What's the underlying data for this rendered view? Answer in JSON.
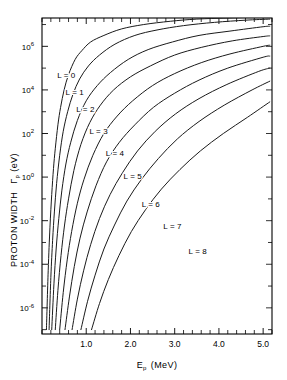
{
  "chart_data": {
    "type": "line",
    "title": "",
    "xlabel": "E_p (MeV)",
    "xlabel_main": "E",
    "xlabel_sub": "p",
    "xlabel_unit": "(MeV)",
    "ylabel": "PROTON WIDTH Γ_p (eV)",
    "ylabel_main": "PROTON  WIDTH",
    "ylabel_symbol": "Γ",
    "ylabel_symbol_sub": "p",
    "ylabel_unit": "(eV)",
    "xlim": [
      0.0,
      5.2
    ],
    "ylim_log10": [
      -7.2,
      7.3
    ],
    "xscale": "linear",
    "yscale": "log",
    "grid": false,
    "legend_position": "inline-annotations",
    "xticks_major": [
      1.0,
      2.0,
      3.0,
      4.0,
      5.0
    ],
    "xtick_labels": [
      "1.0",
      "2.0",
      "3.0",
      "4.0",
      "5.0"
    ],
    "xticks_minor_step": 0.2,
    "yticks_major_log10": [
      6,
      4,
      2,
      0,
      -2,
      -4,
      -6
    ],
    "ytick_labels": [
      "10⁶",
      "10⁴",
      "10²",
      "10⁰",
      "10⁻²",
      "10⁻⁴",
      "10⁻⁶"
    ],
    "ytick_mantissa": "10",
    "ytick_exponents": [
      "6",
      "4",
      "2",
      "0",
      "-2",
      "-4",
      "-6"
    ],
    "yticks_minor_log10": [
      7,
      5,
      3,
      1,
      -1,
      -3,
      -5,
      -7
    ],
    "series": [
      {
        "name": "L = 0",
        "label": "L = 0",
        "label_x": 0.55,
        "label_y_log10": 4.55,
        "points_x": [
          0.1,
          0.14,
          0.18,
          0.22,
          0.26,
          0.3,
          0.36,
          0.42,
          0.5,
          0.6,
          0.75,
          0.9,
          1.1,
          1.4,
          1.8,
          2.3,
          2.9,
          3.5,
          4.2,
          5.0,
          5.15
        ],
        "points_y_log10": [
          -7.0,
          -4.3,
          -2.3,
          -0.8,
          0.4,
          1.3,
          2.4,
          3.2,
          4.0,
          4.7,
          5.4,
          5.8,
          6.2,
          6.5,
          6.8,
          7.0,
          7.15,
          7.25,
          7.3,
          7.35,
          7.35
        ]
      },
      {
        "name": "L = 1",
        "label": "L = 1",
        "label_x": 0.74,
        "label_y_log10": 3.75,
        "points_x": [
          0.16,
          0.2,
          0.24,
          0.28,
          0.33,
          0.4,
          0.48,
          0.58,
          0.7,
          0.85,
          1.05,
          1.3,
          1.65,
          2.1,
          2.6,
          3.2,
          3.9,
          4.6,
          5.15
        ],
        "points_y_log10": [
          -7.0,
          -4.6,
          -2.9,
          -1.6,
          -0.3,
          1.0,
          2.1,
          3.0,
          3.8,
          4.5,
          5.1,
          5.6,
          6.1,
          6.5,
          6.75,
          6.95,
          7.1,
          7.2,
          7.25
        ]
      },
      {
        "name": "L = 2",
        "label": "L = 2",
        "label_x": 0.98,
        "label_y_log10": 3.0,
        "points_x": [
          0.22,
          0.27,
          0.32,
          0.38,
          0.45,
          0.54,
          0.65,
          0.8,
          1.0,
          1.25,
          1.55,
          1.95,
          2.4,
          2.95,
          3.55,
          4.25,
          5.0,
          5.15
        ],
        "points_y_log10": [
          -7.0,
          -4.9,
          -3.3,
          -1.9,
          -0.6,
          0.6,
          1.6,
          2.6,
          3.5,
          4.2,
          4.8,
          5.4,
          5.85,
          6.2,
          6.5,
          6.7,
          6.9,
          6.92
        ]
      },
      {
        "name": "L = 3",
        "label": "L = 3",
        "label_x": 1.28,
        "label_y_log10": 2.0,
        "points_x": [
          0.3,
          0.36,
          0.43,
          0.51,
          0.6,
          0.72,
          0.88,
          1.08,
          1.32,
          1.62,
          2.0,
          2.45,
          3.0,
          3.6,
          4.3,
          5.0,
          5.15
        ],
        "points_y_log10": [
          -7.0,
          -5.2,
          -3.6,
          -2.2,
          -1.0,
          0.3,
          1.5,
          2.5,
          3.3,
          4.0,
          4.6,
          5.1,
          5.6,
          5.95,
          6.25,
          6.45,
          6.48
        ]
      },
      {
        "name": "L = 4",
        "label": "L = 4",
        "label_x": 1.65,
        "label_y_log10": 0.95,
        "points_x": [
          0.4,
          0.48,
          0.57,
          0.67,
          0.8,
          0.95,
          1.15,
          1.4,
          1.7,
          2.05,
          2.5,
          3.0,
          3.6,
          4.25,
          5.0,
          5.15
        ],
        "points_y_log10": [
          -7.0,
          -5.3,
          -3.8,
          -2.5,
          -1.2,
          -0.1,
          1.0,
          2.0,
          2.8,
          3.5,
          4.2,
          4.75,
          5.25,
          5.65,
          6.0,
          6.05
        ]
      },
      {
        "name": "L = 5",
        "label": "L = 5",
        "label_x": 2.05,
        "label_y_log10": -0.1,
        "points_x": [
          0.52,
          0.62,
          0.73,
          0.86,
          1.02,
          1.22,
          1.46,
          1.75,
          2.1,
          2.52,
          3.0,
          3.55,
          4.2,
          5.0,
          5.15
        ],
        "points_y_log10": [
          -7.0,
          -5.5,
          -4.1,
          -2.8,
          -1.6,
          -0.4,
          0.7,
          1.6,
          2.4,
          3.2,
          3.85,
          4.45,
          5.0,
          5.5,
          5.55
        ]
      },
      {
        "name": "L = 6",
        "label": "L = 6",
        "label_x": 2.46,
        "label_y_log10": -1.35,
        "points_x": [
          0.68,
          0.8,
          0.94,
          1.1,
          1.3,
          1.54,
          1.82,
          2.16,
          2.56,
          3.02,
          3.55,
          4.18,
          4.9,
          5.15
        ],
        "points_y_log10": [
          -7.0,
          -5.6,
          -4.3,
          -3.1,
          -1.9,
          -0.8,
          0.2,
          1.2,
          2.1,
          2.9,
          3.6,
          4.25,
          4.85,
          5.0
        ]
      },
      {
        "name": "L = 7",
        "label": "L = 7",
        "label_x": 2.95,
        "label_y_log10": -2.4,
        "points_x": [
          0.88,
          1.03,
          1.2,
          1.4,
          1.64,
          1.92,
          2.25,
          2.63,
          3.06,
          3.55,
          4.12,
          4.75,
          5.15
        ],
        "points_y_log10": [
          -7.0,
          -5.7,
          -4.5,
          -3.3,
          -2.2,
          -1.1,
          -0.1,
          0.85,
          1.75,
          2.55,
          3.3,
          4.0,
          4.4
        ]
      },
      {
        "name": "L = 8",
        "label": "L = 8",
        "label_x": 3.52,
        "label_y_log10": -3.55,
        "points_x": [
          1.12,
          1.3,
          1.5,
          1.74,
          2.02,
          2.34,
          2.7,
          3.12,
          3.58,
          4.1,
          4.65,
          5.15
        ],
        "points_y_log10": [
          -7.0,
          -5.8,
          -4.7,
          -3.6,
          -2.5,
          -1.5,
          -0.55,
          0.35,
          1.2,
          2.0,
          2.75,
          3.45
        ]
      }
    ]
  },
  "colors": {
    "curve": "#1a1a1a",
    "axis": "#000000",
    "background": "#ffffff"
  }
}
